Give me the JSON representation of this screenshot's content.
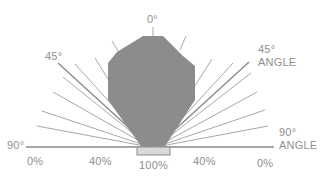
{
  "diagram": {
    "colors": {
      "beam_fill": "#8c8c8c",
      "ray": "#a8a8a8",
      "ray_45": "#8a8a8a",
      "baseline": "#8a8a8a",
      "source_fill": "#d9d9d9",
      "source_stroke": "#8a8a8a",
      "text": "#8f8f8f"
    },
    "labels": {
      "top_angle": "0°",
      "left_45": "45°",
      "right_45": "45°",
      "right_45_caption": "ANGLE",
      "left_90": "90°",
      "right_90": "90°",
      "right_90_caption": "ANGLE"
    },
    "intensity_scale": [
      "0%",
      "40%",
      "100%",
      "40%",
      "0%"
    ]
  }
}
